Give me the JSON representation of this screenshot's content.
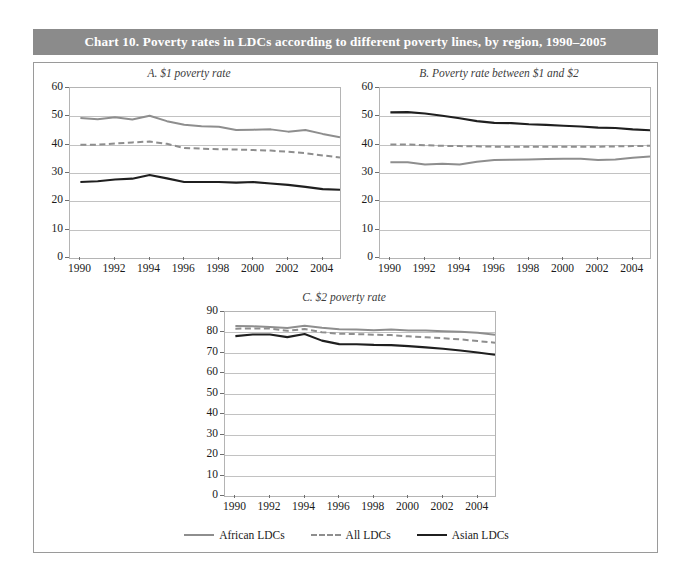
{
  "header": {
    "title": "Chart 10.  Poverty rates in LDCs according to different poverty lines, by region, 1990–2005",
    "bar_color": "#8b8b8b",
    "text_color": "#ffffff"
  },
  "legend": {
    "position": "bottom-center",
    "items": [
      {
        "label": "African LDCs",
        "style": "solid",
        "color": "#8e8e8e",
        "icon": "line-swatch-icon"
      },
      {
        "label": "All LDCs",
        "style": "dashed",
        "color": "#8e8e8e",
        "icon": "dashed-line-swatch-icon"
      },
      {
        "label": "Asian LDCs",
        "style": "solid",
        "color": "#1f1f1f",
        "icon": "line-swatch-icon"
      }
    ]
  },
  "chart_data": [
    {
      "id": "panel-a",
      "type": "line",
      "title": "A.  $1 poverty rate",
      "xlabel": "",
      "ylabel": "",
      "xlim": [
        1989.4,
        2005.0
      ],
      "ylim": [
        0,
        60
      ],
      "ytick_step": 10,
      "yticks": [
        0,
        10,
        20,
        30,
        40,
        50,
        60
      ],
      "xticks": [
        1990,
        1992,
        1994,
        1996,
        1998,
        2000,
        2002,
        2004
      ],
      "x": [
        1990,
        1991,
        1992,
        1993,
        1994,
        1995,
        1996,
        1997,
        1998,
        1999,
        2000,
        2001,
        2002,
        2003,
        2004,
        2005
      ],
      "grid": true,
      "series": [
        {
          "name": "African LDCs",
          "color": "#8e8e8e",
          "style": "solid",
          "values": [
            49.4,
            49.0,
            49.7,
            48.9,
            50.2,
            48.3,
            47.0,
            46.5,
            46.3,
            45.2,
            45.3,
            45.4,
            44.6,
            45.2,
            43.8,
            42.6
          ]
        },
        {
          "name": "All LDCs",
          "color": "#8e8e8e",
          "style": "dashed",
          "values": [
            40.0,
            40.0,
            40.4,
            40.8,
            41.1,
            40.3,
            38.8,
            38.6,
            38.4,
            38.3,
            38.1,
            37.9,
            37.5,
            37.0,
            36.2,
            35.5
          ]
        },
        {
          "name": "Asian LDCs",
          "color": "#1f1f1f",
          "style": "solid",
          "values": [
            26.8,
            27.1,
            27.7,
            28.0,
            29.3,
            28.1,
            26.8,
            26.8,
            26.8,
            26.6,
            26.8,
            26.3,
            25.8,
            25.1,
            24.3,
            24.1
          ]
        }
      ]
    },
    {
      "id": "panel-b",
      "type": "line",
      "title": "B.  Poverty rate between $1 and $2",
      "xlabel": "",
      "ylabel": "",
      "xlim": [
        1989.4,
        2005.0
      ],
      "ylim": [
        0,
        60
      ],
      "ytick_step": 10,
      "yticks": [
        0,
        10,
        20,
        30,
        40,
        50,
        60
      ],
      "xticks": [
        1990,
        1992,
        1994,
        1996,
        1998,
        2000,
        2002,
        2004
      ],
      "x": [
        1990,
        1991,
        1992,
        1993,
        1994,
        1995,
        1996,
        1997,
        1998,
        1999,
        2000,
        2001,
        2002,
        2003,
        2004,
        2005
      ],
      "grid": true,
      "series": [
        {
          "name": "African LDCs",
          "color": "#8e8e8e",
          "style": "solid",
          "values": [
            33.8,
            33.8,
            33.0,
            33.3,
            33.0,
            34.0,
            34.6,
            34.7,
            34.8,
            34.9,
            35.0,
            35.0,
            34.6,
            34.8,
            35.4,
            35.8
          ]
        },
        {
          "name": "All LDCs",
          "color": "#8e8e8e",
          "style": "dashed",
          "values": [
            40.1,
            40.1,
            39.8,
            39.6,
            39.5,
            39.4,
            39.3,
            39.3,
            39.3,
            39.3,
            39.3,
            39.3,
            39.3,
            39.4,
            39.5,
            39.6
          ]
        },
        {
          "name": "Asian LDCs",
          "color": "#1f1f1f",
          "style": "solid",
          "values": [
            51.4,
            51.5,
            51.0,
            50.2,
            49.3,
            48.3,
            47.7,
            47.6,
            47.2,
            47.0,
            46.7,
            46.4,
            46.0,
            45.9,
            45.4,
            45.1
          ]
        }
      ]
    },
    {
      "id": "panel-c",
      "type": "line",
      "title": "C.  $2 poverty rate",
      "xlabel": "",
      "ylabel": "",
      "xlim": [
        1989.4,
        2005.0
      ],
      "ylim": [
        0,
        90
      ],
      "ytick_step": 10,
      "yticks": [
        0,
        10,
        20,
        30,
        40,
        50,
        60,
        70,
        80,
        90
      ],
      "xticks": [
        1990,
        1992,
        1994,
        1996,
        1998,
        2000,
        2002,
        2004
      ],
      "x": [
        1990,
        1991,
        1992,
        1993,
        1994,
        1995,
        1996,
        1997,
        1998,
        1999,
        2000,
        2001,
        2002,
        2003,
        2004,
        2005
      ],
      "grid": true,
      "series": [
        {
          "name": "African LDCs",
          "color": "#8e8e8e",
          "style": "solid",
          "values": [
            83.2,
            83.0,
            82.7,
            82.2,
            83.3,
            82.3,
            81.6,
            81.4,
            81.1,
            81.4,
            81.0,
            80.9,
            80.6,
            80.4,
            79.9,
            78.9
          ]
        },
        {
          "name": "All LDCs",
          "color": "#8e8e8e",
          "style": "dashed",
          "values": [
            81.8,
            82.0,
            81.9,
            80.8,
            81.7,
            80.1,
            79.4,
            79.2,
            78.9,
            78.7,
            78.1,
            77.6,
            77.2,
            76.6,
            75.8,
            75.0
          ]
        },
        {
          "name": "Asian LDCs",
          "color": "#1f1f1f",
          "style": "solid",
          "values": [
            78.2,
            79.0,
            79.0,
            77.7,
            79.2,
            76.0,
            74.3,
            74.2,
            73.9,
            73.8,
            73.3,
            72.7,
            72.0,
            71.2,
            70.2,
            69.1
          ]
        }
      ]
    }
  ]
}
